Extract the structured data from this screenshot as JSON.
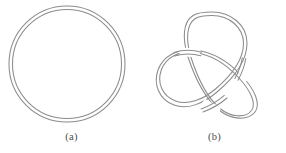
{
  "figure": {
    "background_color": "#ffffff",
    "stroke_color": "#8c8c8c",
    "caption_color": "#4d4d4d",
    "panels": [
      {
        "id": "a",
        "caption": "(a)",
        "subject": "unknot",
        "description": "double-line circle (unknotted band)",
        "crossings": 0,
        "geometry": {
          "center_x": 67,
          "center_y": 64,
          "outer_radius": 58,
          "inner_radius": 54.5
        }
      },
      {
        "id": "b",
        "caption": "(b)",
        "subject": "trefoil-knot",
        "description": "double-line trefoil knot with three crossings",
        "crossings": 3,
        "geometry": {
          "center_x": 69,
          "center_y": 70,
          "outer_radius": 56,
          "inner_radius": 52
        }
      }
    ]
  }
}
